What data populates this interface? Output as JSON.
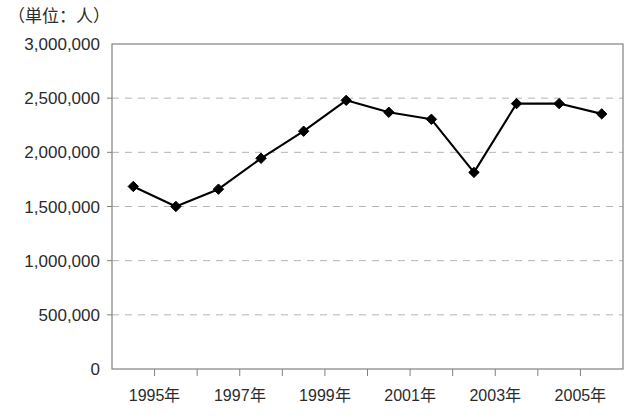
{
  "chart_data": {
    "type": "line",
    "title": "（単位：人）",
    "xlabel": "",
    "ylabel": "",
    "ylim": [
      0,
      3000000
    ],
    "grid": true,
    "legend": false,
    "y_ticks": [
      0,
      500000,
      1000000,
      1500000,
      2000000,
      2500000,
      3000000
    ],
    "y_tick_labels": [
      "0",
      "500,000",
      "1,000,000",
      "1,500,000",
      "2,000,000",
      "2,500,000",
      "3,000,000"
    ],
    "categories": [
      "1995年",
      "1996年",
      "1997年",
      "1998年",
      "1999年",
      "2000年",
      "2001年",
      "2002年",
      "2003年",
      "2004年",
      "2005年",
      "2006年"
    ],
    "x_tick_labels_shown": [
      "1995年",
      "1997年",
      "1999年",
      "2001年",
      "2003年",
      "2005年"
    ],
    "values": [
      1685000,
      1500000,
      1660000,
      1945000,
      2195000,
      2480000,
      2370000,
      2305000,
      1815000,
      2450000,
      2450000,
      2355000
    ],
    "marker": "diamond",
    "line_color": "#000000",
    "marker_color": "#000000",
    "grid_color": "#b4b4b4",
    "axis_color": "#808080"
  }
}
